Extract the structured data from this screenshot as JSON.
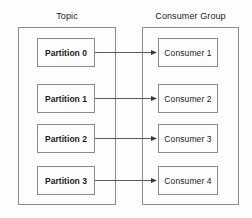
{
  "diagram": {
    "background_color": "#fdfdfd",
    "border_color": "#8a8a8a",
    "text_color": "#1a1a1a",
    "groups": [
      {
        "id": "topic",
        "caption": "Topic"
      },
      {
        "id": "consumer_group",
        "caption": "Consumer Group"
      }
    ],
    "partitions": [
      {
        "label": "Partition 0"
      },
      {
        "label": "Partition 1"
      },
      {
        "label": "Partition 2"
      },
      {
        "label": "Partition 3"
      }
    ],
    "consumers": [
      {
        "label": "Consumer 1"
      },
      {
        "label": "Consumer 2"
      },
      {
        "label": "Consumer 3"
      },
      {
        "label": "Consumer 4"
      }
    ],
    "connections": [
      {
        "from": "Partition 0",
        "to": "Consumer 1",
        "style": "arrow"
      },
      {
        "from": "Partition 1",
        "to": "Consumer 2",
        "style": "arrow"
      },
      {
        "from": "Partition 2",
        "to": "Consumer 3",
        "style": "arrow"
      },
      {
        "from": "Partition 3",
        "to": "Consumer 4",
        "style": "arrow"
      }
    ]
  }
}
